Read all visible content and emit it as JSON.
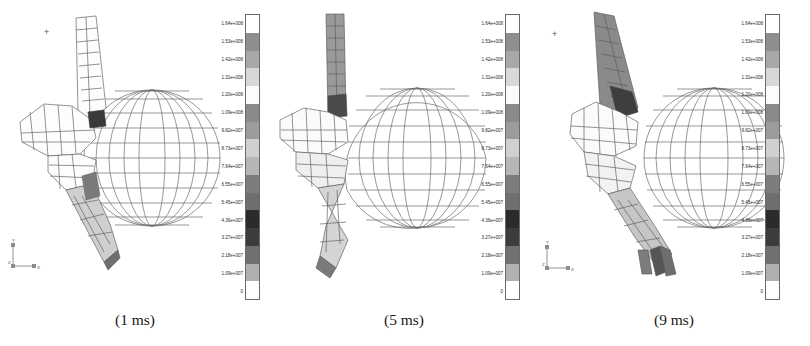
{
  "figure": {
    "title": "",
    "panel_count": 3,
    "background": "#ffffff"
  },
  "panels": [
    {
      "id": "panel-1",
      "caption": "(1 ms)",
      "time_ms": 1,
      "origin_marker": "+",
      "axis_triad": {
        "y_label": "Y",
        "x_label": "X",
        "z_label": "Z"
      },
      "objects": [
        "foot-ankle-fe-mesh",
        "ball-wireframe-mesh"
      ]
    },
    {
      "id": "panel-2",
      "caption": "(5 ms)",
      "time_ms": 5,
      "origin_marker": "+",
      "axis_triad": {
        "y_label": "Y",
        "x_label": "X",
        "z_label": "Z"
      },
      "objects": [
        "foot-ankle-fe-mesh",
        "ball-wireframe-mesh"
      ]
    },
    {
      "id": "panel-3",
      "caption": "(9 ms)",
      "time_ms": 9,
      "origin_marker": "+",
      "axis_triad": {
        "y_label": "Y",
        "x_label": "X",
        "z_label": "Z"
      },
      "objects": [
        "foot-ankle-fe-mesh",
        "ball-wireframe-mesh"
      ]
    }
  ],
  "colorbar": {
    "orientation": "vertical",
    "label_count": 16,
    "labels": [
      "1.64e+008",
      "1.53e+008",
      "1.42e+008",
      "1.31e+008",
      "1.20e+008",
      "1.09e+008",
      "9.82e+007",
      "8.73e+007",
      "7.64e+007",
      "6.55e+007",
      "5.45e+007",
      "4.36e+007",
      "3.27e+007",
      "2.18e+007",
      "1.09e+007",
      "0"
    ],
    "swatches": [
      "#ffffff",
      "#8e8e8e",
      "#a8a8a8",
      "#d8d8d8",
      "#fbfbfb",
      "#8a8a8a",
      "#9c9c9c",
      "#d0d0d0",
      "#b6b6b6",
      "#7d7d7d",
      "#6e6e6e",
      "#2b2b2b",
      "#3c3c3c",
      "#707070",
      "#b0b0b0",
      "#ffffff"
    ]
  },
  "chart_data": {
    "type": "heatmap",
    "xlabel": "",
    "ylabel": "",
    "legend_position": "right-of-each-panel",
    "grid": false,
    "colorbar_unit": "Pa",
    "categories": [
      "(1 ms)",
      "(5 ms)",
      "(9 ms)"
    ],
    "series": [
      {
        "name": "contact time (ms)",
        "values": [
          1,
          5,
          9
        ]
      }
    ],
    "scale_min": 0,
    "scale_max": 164000000,
    "tick_values": [
      164000000,
      153000000,
      142000000,
      131000000,
      120000000,
      109000000,
      98200000,
      87300000,
      76400000,
      65500000,
      54500000,
      43600000,
      32700000,
      21800000,
      10900000,
      0
    ],
    "tick_labels": [
      "1.64e+008",
      "1.53e+008",
      "1.42e+008",
      "1.31e+008",
      "1.20e+008",
      "1.09e+008",
      "9.82e+007",
      "8.73e+007",
      "7.64e+007",
      "6.55e+007",
      "5.45e+007",
      "4.36e+007",
      "3.27e+007",
      "2.18e+007",
      "1.09e+007",
      "0"
    ]
  }
}
